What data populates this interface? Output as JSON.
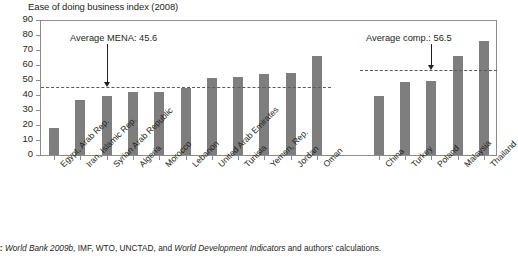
{
  "chart_data": {
    "type": "bar",
    "title": "Ease of doing business index (2008)",
    "xlabel": "",
    "ylabel": "",
    "ylim": [
      0,
      90
    ],
    "ytick_step": 10,
    "yticks": [
      0,
      10,
      20,
      30,
      40,
      50,
      60,
      70,
      80,
      90
    ],
    "grid": false,
    "legend": "none",
    "orientation": "vertical",
    "bar_color": "#7e7e7e",
    "groups": [
      {
        "name": "MENA",
        "categories": [
          "Egypt, Arab Rep.",
          "Iran, Islamic Rep.",
          "Syrian Arab Republic",
          "Algeria",
          "Morocco",
          "Lebanon",
          "United Arab Emirates",
          "Tunisia",
          "Yemen, Rep.",
          "Jordan",
          "Oman"
        ],
        "values": [
          18,
          37,
          39.5,
          42,
          42,
          45,
          51.5,
          52,
          54,
          54.5,
          66
        ]
      },
      {
        "name": "Comparators",
        "categories": [
          "China",
          "Turkey",
          "Poland",
          "Malaysia",
          "Thailand"
        ],
        "values": [
          39.5,
          49,
          49.5,
          66,
          76
        ]
      }
    ],
    "categories": [
      "Egypt, Arab Rep.",
      "Iran, Islamic Rep.",
      "Syrian Arab Republic",
      "Algeria",
      "Morocco",
      "Lebanon",
      "United Arab Emirates",
      "Tunisia",
      "Yemen, Rep.",
      "Jordan",
      "Oman",
      "China",
      "Turkey",
      "Poland",
      "Malaysia",
      "Thailand"
    ],
    "values": [
      18,
      37,
      39.5,
      42,
      42,
      45,
      51.5,
      52,
      54,
      54.5,
      66,
      39.5,
      49,
      49.5,
      66,
      76
    ],
    "reference_lines": [
      {
        "label": "Average MENA: 45.6",
        "value": 45.6,
        "style": "dashed",
        "color": "#5a5a5a",
        "spans": "mena"
      },
      {
        "label": "Average comp.: 56.5",
        "value": 56.5,
        "style": "dashed",
        "color": "#5a5a5a",
        "spans": "comparators"
      }
    ],
    "annotations": [
      {
        "text": "Average MENA: 45.6",
        "points_to": "Syrian Arab Republic"
      },
      {
        "text": "Average comp.: 56.5",
        "points_to": "Poland"
      }
    ]
  },
  "source": {
    "prefix": "ces:",
    "full_label": "Sources:",
    "italic_1": "World Bank 2009b,",
    "plain_1": " IMF, WTO, UNCTAD, and ",
    "italic_2": "World Development Indicators",
    "plain_2": " and authors' calculations."
  }
}
